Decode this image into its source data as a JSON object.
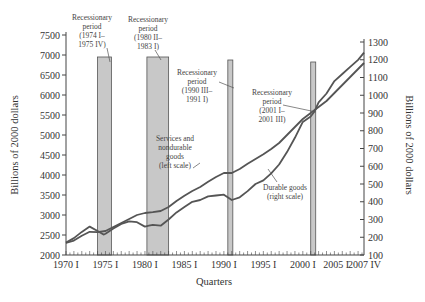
{
  "chart_data": {
    "type": "line",
    "title": "",
    "xlabel": "Quarters",
    "ylabel_left": "Billions of 2000 dollars",
    "ylabel_right": "Billions of 2000 dollars",
    "ylim_left": [
      2000,
      7500
    ],
    "ylim_right": [
      100,
      1300
    ],
    "grid": false,
    "x_tick_labels": [
      "1970 I",
      "1975 I",
      "1980 I",
      "1985 I",
      "1990 I",
      "1995 I",
      "2000 I",
      "2005 I",
      "2007 IV"
    ],
    "x_ticks_year": [
      1970,
      1975,
      1980,
      1985,
      1990,
      1995,
      2000,
      2005,
      2007.75
    ],
    "y_left_ticks": [
      2000,
      2500,
      3000,
      3500,
      4000,
      4500,
      5000,
      5500,
      6000,
      6500,
      7000,
      7500
    ],
    "y_right_ticks": [
      100,
      200,
      300,
      400,
      500,
      600,
      700,
      800,
      900,
      1000,
      1100,
      1200,
      1300
    ],
    "series": [
      {
        "name": "Services and nondurable goods (left scale)",
        "axis": "left",
        "x": [
          1970,
          1971,
          1972,
          1973,
          1974,
          1975,
          1976,
          1977,
          1978,
          1979,
          1980,
          1981,
          1982,
          1983,
          1984,
          1985,
          1986,
          1987,
          1988,
          1989,
          1990,
          1991,
          1992,
          1993,
          1994,
          1995,
          1996,
          1997,
          1998,
          1999,
          2000,
          2001,
          2002,
          2003,
          2004,
          2005,
          2006,
          2007,
          2007.75
        ],
        "values": [
          2300,
          2360,
          2480,
          2580,
          2570,
          2600,
          2700,
          2800,
          2900,
          3000,
          3050,
          3070,
          3100,
          3200,
          3350,
          3480,
          3600,
          3700,
          3830,
          3950,
          4050,
          4050,
          4150,
          4280,
          4400,
          4520,
          4650,
          4800,
          5000,
          5200,
          5400,
          5550,
          5700,
          5850,
          6050,
          6250,
          6450,
          6650,
          6800
        ]
      },
      {
        "name": "Durable goods (right scale)",
        "axis": "right",
        "x": [
          1970,
          1971,
          1972,
          1973,
          1974,
          1974.75,
          1975,
          1976,
          1977,
          1978,
          1979,
          1980,
          1980.5,
          1981,
          1982,
          1983,
          1984,
          1985,
          1986,
          1987,
          1988,
          1989,
          1990,
          1991,
          1992,
          1993,
          1994,
          1995,
          1996,
          1997,
          1998,
          1999,
          2000,
          2001,
          2001.5,
          2002,
          2003,
          2004,
          2005,
          2006,
          2007,
          2007.75
        ],
        "values": [
          170,
          195,
          230,
          260,
          235,
          215,
          220,
          250,
          275,
          290,
          285,
          260,
          265,
          270,
          265,
          300,
          340,
          370,
          400,
          410,
          430,
          435,
          440,
          410,
          425,
          460,
          500,
          520,
          560,
          610,
          680,
          760,
          850,
          880,
          910,
          960,
          1010,
          1080,
          1120,
          1160,
          1200,
          1240
        ]
      }
    ],
    "recessions": [
      {
        "label": "Recessionary period (1974 I– 1975 IV)",
        "start": 1974.0,
        "end": 1975.75
      },
      {
        "label": "Recessionary period (1980 II– 1983 I)",
        "start": 1980.25,
        "end": 1983.0
      },
      {
        "label": "Recessionary period (1990 III– 1991 I)",
        "start": 1990.5,
        "end": 1991.0
      },
      {
        "label": "Recessionary period (2001 I– 2001 III)",
        "start": 2001.0,
        "end": 2001.5
      }
    ],
    "annotations": [
      {
        "text": "Services and nondurable goods (left scale)"
      },
      {
        "text": "Durable goods (right scale)"
      }
    ]
  },
  "labels": {
    "rec1": [
      "Recessionary",
      "period",
      "(1974 I–",
      "1975 IV)"
    ],
    "rec2": [
      "Recessionary",
      "period",
      "(1980 II–",
      "1983 I)"
    ],
    "rec3": [
      "Recessionary",
      "period",
      "(1990 III–",
      "1991 I)"
    ],
    "rec4": [
      "Recessionary",
      "period",
      "(2001 I–",
      "2001 III)"
    ],
    "services": [
      "Services and",
      "nondurable",
      "goods",
      "(left scale)"
    ],
    "durable": [
      "Durable goods",
      "(right scale)"
    ],
    "xlabel": "Quarters",
    "ylabel_left": "Billions of 2000 dollars",
    "ylabel_right": "Billions of 2000 dollars"
  },
  "colors": {
    "line": "#555555",
    "bar_fill": "#c8c8c8",
    "bar_stroke": "#555555",
    "axis": "#444444"
  }
}
